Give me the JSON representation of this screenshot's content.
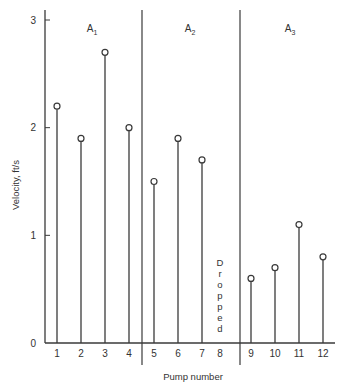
{
  "chart_data": {
    "type": "stem",
    "title": "",
    "xlabel": "Pump number",
    "ylabel": "Velocity, ft/s",
    "ylim": [
      0,
      3
    ],
    "yticks": [
      0,
      1,
      2,
      3
    ],
    "grid": false,
    "categories": [
      "1",
      "2",
      "3",
      "4",
      "5",
      "6",
      "7",
      "8",
      "9",
      "10",
      "11",
      "12"
    ],
    "values": [
      2.2,
      1.9,
      2.7,
      2.0,
      1.5,
      1.9,
      1.7,
      null,
      0.6,
      0.7,
      1.1,
      0.8
    ],
    "regions": [
      {
        "label": "A",
        "subscript": "1",
        "pumps": [
          1,
          2,
          3,
          4
        ]
      },
      {
        "label": "A",
        "subscript": "2",
        "pumps": [
          5,
          6,
          7,
          8
        ]
      },
      {
        "label": "A",
        "subscript": "3",
        "pumps": [
          9,
          10,
          11,
          12
        ]
      }
    ],
    "annotations": [
      {
        "pump": 8,
        "text": "Dropped",
        "orientation": "vertical-stacked"
      }
    ]
  },
  "labels": {
    "xlabel": "Pump number",
    "ylabel": "Velocity, ft/s",
    "dropped": "Dropped"
  }
}
